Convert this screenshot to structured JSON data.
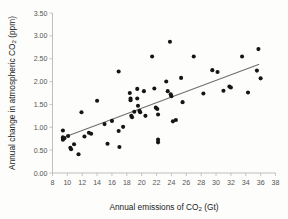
{
  "chart_data": {
    "type": "scatter",
    "title": "",
    "xlabel": "Annual emissions of CO2 (Gt)",
    "ylabel": "Annual change in atmospheric CO2 (ppm)",
    "xlabel_parts": {
      "pre": "Annual emissions of CO",
      "sub": "2",
      "post": " (Gt)"
    },
    "ylabel_parts": {
      "pre": "Annual change in atmospheric CO",
      "sub": "2",
      "post": " (ppm)"
    },
    "xlim": [
      8,
      38
    ],
    "ylim": [
      0.0,
      3.5
    ],
    "xticks": [
      8,
      10,
      12,
      14,
      16,
      18,
      20,
      22,
      24,
      26,
      28,
      30,
      32,
      34,
      36,
      38
    ],
    "xtick_labels": [
      "8",
      "10",
      "12",
      "14",
      "16",
      "18",
      "20",
      "22",
      "24",
      "26",
      "28",
      "30",
      "32",
      "34",
      "36",
      "38"
    ],
    "yticks": [
      0.0,
      0.5,
      1.0,
      1.5,
      2.0,
      2.5,
      3.0,
      3.5
    ],
    "ytick_labels": [
      "0.00",
      "0.50",
      "1.00",
      "1.50",
      "2.00",
      "2.50",
      "3.00",
      "3.50"
    ],
    "grid": false,
    "legend": null,
    "marker": "filled-circle",
    "marker_color": "#151515",
    "trendline": {
      "type": "linear",
      "color": "#6e6e6e",
      "x_start": 9.2,
      "y_start": 0.76,
      "x_end": 35.8,
      "y_end": 2.38
    },
    "points": [
      {
        "x": 9.4,
        "y": 0.93
      },
      {
        "x": 9.4,
        "y": 0.78
      },
      {
        "x": 9.4,
        "y": 0.73
      },
      {
        "x": 9.6,
        "y": 0.76
      },
      {
        "x": 10.1,
        "y": 0.81
      },
      {
        "x": 10.4,
        "y": 0.55
      },
      {
        "x": 10.5,
        "y": 0.52
      },
      {
        "x": 10.9,
        "y": 0.63
      },
      {
        "x": 11.5,
        "y": 0.41
      },
      {
        "x": 11.9,
        "y": 1.33
      },
      {
        "x": 12.3,
        "y": 0.8
      },
      {
        "x": 12.9,
        "y": 0.88
      },
      {
        "x": 13.2,
        "y": 0.86
      },
      {
        "x": 14.0,
        "y": 1.58
      },
      {
        "x": 15.0,
        "y": 1.07
      },
      {
        "x": 15.4,
        "y": 0.64
      },
      {
        "x": 16.0,
        "y": 1.14
      },
      {
        "x": 16.9,
        "y": 2.22
      },
      {
        "x": 16.9,
        "y": 0.92
      },
      {
        "x": 17.0,
        "y": 0.57
      },
      {
        "x": 17.5,
        "y": 1.01
      },
      {
        "x": 18.4,
        "y": 1.75
      },
      {
        "x": 18.5,
        "y": 1.63
      },
      {
        "x": 18.5,
        "y": 1.59
      },
      {
        "x": 18.6,
        "y": 1.25
      },
      {
        "x": 18.7,
        "y": 1.22
      },
      {
        "x": 19.0,
        "y": 1.34
      },
      {
        "x": 19.4,
        "y": 1.84
      },
      {
        "x": 19.4,
        "y": 1.63
      },
      {
        "x": 19.5,
        "y": 1.47
      },
      {
        "x": 19.7,
        "y": 1.36
      },
      {
        "x": 19.8,
        "y": 1.33
      },
      {
        "x": 20.3,
        "y": 1.79
      },
      {
        "x": 20.5,
        "y": 1.25
      },
      {
        "x": 21.4,
        "y": 2.55
      },
      {
        "x": 21.7,
        "y": 1.85
      },
      {
        "x": 21.9,
        "y": 1.43
      },
      {
        "x": 22.1,
        "y": 1.4
      },
      {
        "x": 22.2,
        "y": 1.28
      },
      {
        "x": 22.2,
        "y": 0.73
      },
      {
        "x": 22.2,
        "y": 0.67
      },
      {
        "x": 23.3,
        "y": 2.0
      },
      {
        "x": 23.5,
        "y": 1.79
      },
      {
        "x": 23.8,
        "y": 2.87
      },
      {
        "x": 23.9,
        "y": 1.72
      },
      {
        "x": 24.0,
        "y": 1.68
      },
      {
        "x": 24.2,
        "y": 1.13
      },
      {
        "x": 24.6,
        "y": 1.16
      },
      {
        "x": 25.3,
        "y": 2.08
      },
      {
        "x": 25.5,
        "y": 1.55
      },
      {
        "x": 27.0,
        "y": 2.55
      },
      {
        "x": 28.3,
        "y": 1.74
      },
      {
        "x": 29.5,
        "y": 2.25
      },
      {
        "x": 30.2,
        "y": 2.21
      },
      {
        "x": 31.0,
        "y": 1.8
      },
      {
        "x": 31.8,
        "y": 1.89
      },
      {
        "x": 32.0,
        "y": 1.87
      },
      {
        "x": 33.5,
        "y": 2.55
      },
      {
        "x": 34.3,
        "y": 1.76
      },
      {
        "x": 35.5,
        "y": 2.24
      },
      {
        "x": 35.7,
        "y": 2.71
      },
      {
        "x": 36.0,
        "y": 2.07
      }
    ]
  }
}
